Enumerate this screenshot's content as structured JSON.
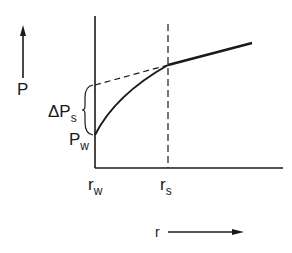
{
  "diagram": {
    "y_axis_label": "P",
    "x_axis_label": "r",
    "delta_label_main": "ΔP",
    "delta_label_sub": "s",
    "pw_label_main": "P",
    "pw_label_sub": "w",
    "rw_label_main": "r",
    "rw_label_sub": "w",
    "rs_label_main": "r",
    "rs_label_sub": "s",
    "line_color": "#1a1a1a",
    "background": "#ffffff"
  }
}
